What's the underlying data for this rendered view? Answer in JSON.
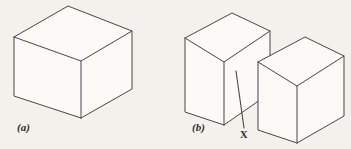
{
  "figure": {
    "kind": "line-drawing",
    "background_color": "#f3f1ec",
    "line_color": "#46464a",
    "face_color": "#fbfaf7",
    "label_color": "#2b2b2e",
    "panels": [
      {
        "id": "a",
        "label": "(a)",
        "description": "single cube drawn in oblique/isometric projection",
        "solids": [
          {
            "name": "cube",
            "top_face": [
              [
                14,
                37
              ],
              [
                68,
                6
              ],
              [
                132,
                31
              ],
              [
                81,
                61
              ]
            ],
            "left_face": [
              [
                14,
                37
              ],
              [
                81,
                61
              ],
              [
                81,
                118
              ],
              [
                14,
                96
              ]
            ],
            "right_face": [
              [
                81,
                61
              ],
              [
                132,
                31
              ],
              [
                132,
                89
              ],
              [
                81,
                118
              ]
            ]
          }
        ]
      },
      {
        "id": "b",
        "label": "(b)",
        "description": "two offset rectangular blocks separated by a step, with a leader line pointing to the gap feature",
        "solids": [
          {
            "name": "block-left",
            "top_face": [
              [
                185,
                38
              ],
              [
                232,
                13
              ],
              [
                270,
                31
              ],
              [
                224,
                62
              ]
            ],
            "left_face": [
              [
                185,
                38
              ],
              [
                224,
                62
              ],
              [
                224,
                125
              ],
              [
                185,
                112
              ]
            ],
            "right_face": [
              [
                224,
                62
              ],
              [
                270,
                31
              ],
              [
                270,
                93
              ],
              [
                224,
                125
              ]
            ]
          },
          {
            "name": "block-right",
            "top_face": [
              [
                258,
                62
              ],
              [
                305,
                37
              ],
              [
                344,
                56
              ],
              [
                297,
                86
              ]
            ],
            "left_face": [
              [
                258,
                62
              ],
              [
                297,
                86
              ],
              [
                297,
                143
              ],
              [
                258,
                130
              ]
            ],
            "right_face": [
              [
                297,
                86
              ],
              [
                344,
                56
              ],
              [
                344,
                116
              ],
              [
                297,
                143
              ]
            ]
          }
        ],
        "callout": {
          "label": "X",
          "leader_from": [
            236,
            71
          ],
          "leader_to": [
            244,
            128
          ]
        }
      }
    ]
  }
}
